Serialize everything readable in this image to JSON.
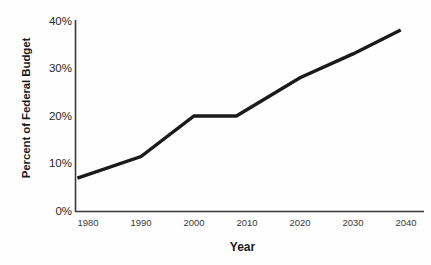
{
  "chart_data": {
    "type": "line",
    "title": "",
    "xlabel": "Year",
    "ylabel": "Percent of Federal Budget",
    "xlim": [
      1978,
      2040
    ],
    "ylim": [
      0,
      40
    ],
    "xticks": [
      1980,
      1990,
      2000,
      2010,
      2020,
      2030,
      2040
    ],
    "xtick_labels": [
      "1980",
      "1990",
      "2000",
      "2010",
      "2020",
      "2030",
      "2040"
    ],
    "yticks": [
      0,
      10,
      20,
      30,
      40
    ],
    "ytick_labels": [
      "0%",
      "10%",
      "20%",
      "30%",
      "40%"
    ],
    "grid": false,
    "legend": false,
    "line_color": "#1a1a1a",
    "line_width": 3.4,
    "x": [
      1978,
      1990,
      2000,
      2008,
      2020,
      2030,
      2039
    ],
    "values": [
      7,
      11.5,
      20,
      20,
      28,
      33,
      38
    ],
    "series": [
      {
        "name": "Percent of Federal Budget",
        "points": [
          {
            "x": 1978,
            "y": 7
          },
          {
            "x": 1990,
            "y": 11.5
          },
          {
            "x": 2000,
            "y": 20
          },
          {
            "x": 2008,
            "y": 20
          },
          {
            "x": 2020,
            "y": 28
          },
          {
            "x": 2030,
            "y": 33
          },
          {
            "x": 2039,
            "y": 38
          }
        ]
      }
    ]
  },
  "axis": {
    "y_title": "Percent of Federal Budget",
    "x_title": "Year",
    "y_labels": [
      "40%",
      "30%",
      "20%",
      "10%",
      "0%"
    ],
    "x_labels": [
      "1980",
      "1990",
      "2000",
      "2010",
      "2020",
      "2030",
      "2040"
    ]
  }
}
